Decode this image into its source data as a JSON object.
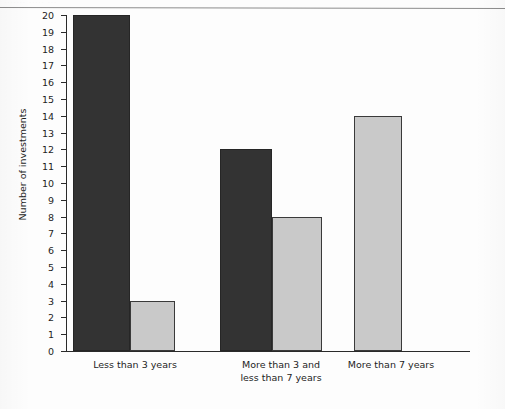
{
  "page": {
    "cut_header_text": "....... ..... ..."
  },
  "chart_data": {
    "type": "bar",
    "title": "",
    "xlabel": "",
    "ylabel": "Number of investments",
    "ylim": [
      0,
      20
    ],
    "ytick_step": 1,
    "grid": false,
    "legend": "none",
    "orientation": "vertical",
    "grouped": true,
    "categories": [
      "Less than 3 years",
      "More than 3 and\nless than 7 years",
      "More than 7 years"
    ],
    "yticks": [
      "0",
      "1",
      "2",
      "3",
      "4",
      "5",
      "6",
      "7",
      "8",
      "9",
      "10",
      "11",
      "12",
      "13",
      "14",
      "15",
      "16",
      "17",
      "18",
      "19",
      "20"
    ],
    "series": [
      {
        "name": "dark-series",
        "color": "#333333",
        "values": [
          20,
          12,
          null
        ]
      },
      {
        "name": "light-series",
        "color": "#c9c9c9",
        "values": [
          3,
          8,
          14
        ]
      }
    ]
  }
}
